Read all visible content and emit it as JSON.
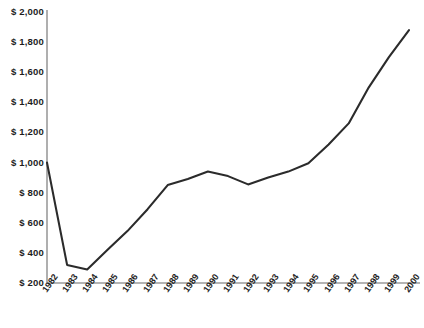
{
  "chart_data": {
    "type": "line",
    "title": "",
    "subtitle": "",
    "xlabel": "",
    "ylabel": "",
    "grid": false,
    "legend": "none",
    "categories": [
      "1982",
      "1983",
      "1984",
      "1985",
      "1986",
      "1987",
      "1988",
      "1989",
      "1990",
      "1991",
      "1992",
      "1993",
      "1994",
      "1995",
      "1996",
      "1997",
      "1998",
      "1999",
      "2000"
    ],
    "values": [
      1000,
      320,
      290,
      420,
      545,
      690,
      850,
      890,
      940,
      910,
      855,
      900,
      940,
      995,
      1120,
      1260,
      1500,
      1700,
      1880
    ],
    "series": [
      {
        "name": "",
        "values": [
          1000,
          320,
          290,
          420,
          545,
          690,
          850,
          890,
          940,
          910,
          855,
          900,
          940,
          995,
          1120,
          1260,
          1500,
          1700,
          1880
        ]
      }
    ],
    "ylim": [
      200,
      2000
    ],
    "ytick_values": [
      2000,
      1800,
      1600,
      1400,
      1200,
      1000,
      800,
      600,
      400,
      200
    ],
    "ytick_labels": [
      "$ 2,000",
      "$ 1,800",
      "$ 1,600",
      "$ 1,400",
      "$ 1,200",
      "$ 1,000",
      "$ 800",
      "$ 600",
      "$ 400",
      "$ 200"
    ],
    "line_color": "#2b2b2b",
    "axis_color": "#9b9b9b",
    "background_color": "#ffffff"
  }
}
